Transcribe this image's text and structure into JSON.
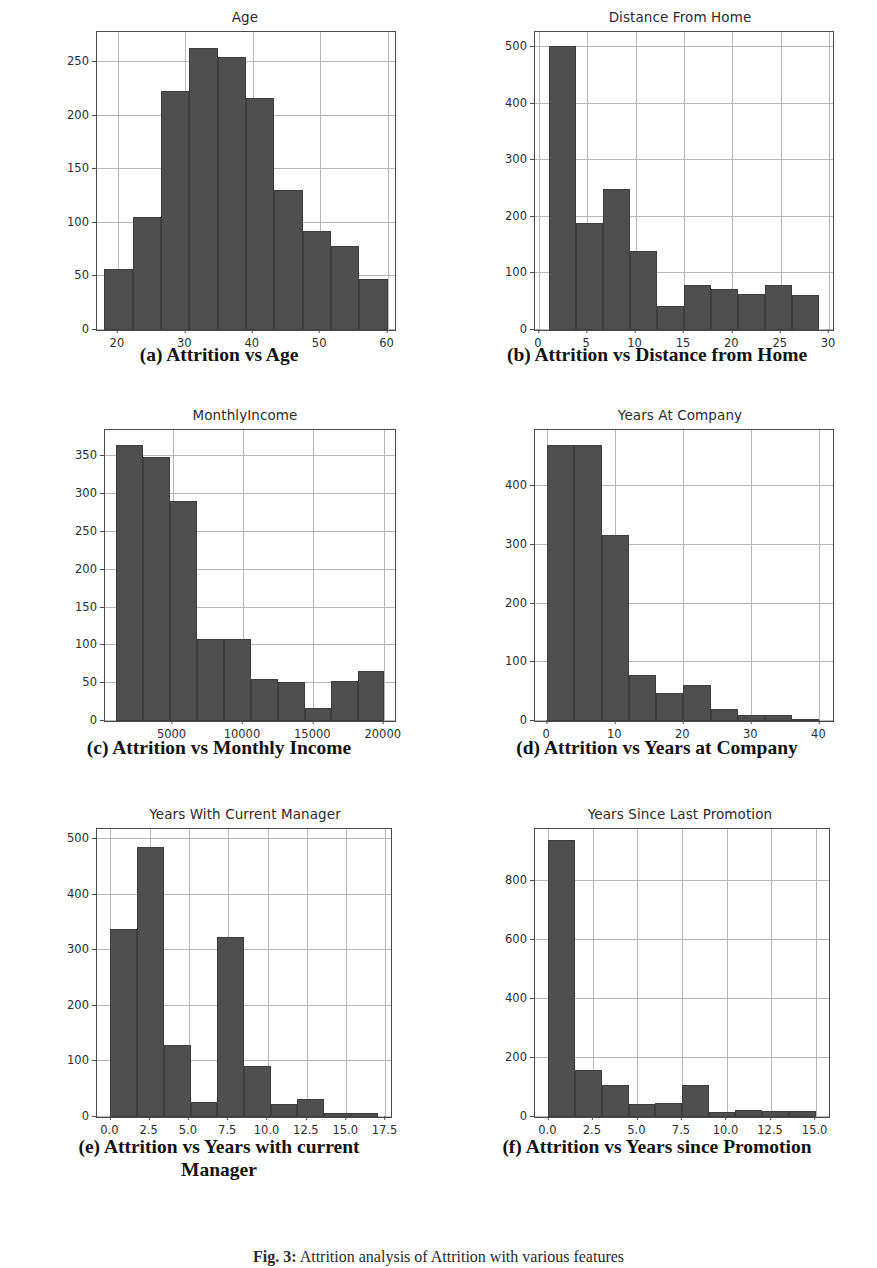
{
  "figure": {
    "caption_label": "Fig. 3:",
    "caption_text": "Attrition analysis of Attrition with various features"
  },
  "panels": [
    {
      "key": "a",
      "subcaption": "(a) Attrition vs Age",
      "chart_data": {
        "type": "bar",
        "title": "Age",
        "xlabel": "",
        "ylabel": "",
        "grid": true,
        "legend": "none",
        "xlim": [
          16.9,
          61.1
        ],
        "ylim": [
          0,
          278
        ],
        "xticks": [
          "20",
          "30",
          "40",
          "50",
          "60"
        ],
        "xtick_values": [
          20,
          30,
          40,
          50,
          60
        ],
        "yticks": [
          "0",
          "50",
          "100",
          "150",
          "200",
          "250"
        ],
        "ytick_values": [
          0,
          50,
          100,
          150,
          200,
          250
        ],
        "bin_edges": [
          18,
          22.2,
          26.4,
          30.6,
          34.8,
          39,
          43.2,
          47.4,
          51.6,
          55.8,
          60
        ],
        "categories": [
          "18-22.2",
          "22.2-26.4",
          "26.4-30.6",
          "30.6-34.8",
          "34.8-39",
          "39-43.2",
          "43.2-47.4",
          "47.4-51.6",
          "51.6-55.8",
          "55.8-60"
        ],
        "values": [
          57,
          105,
          223,
          263,
          255,
          216,
          131,
          92,
          78,
          48
        ]
      }
    },
    {
      "key": "b",
      "subcaption": "(b) Attrition vs Distance from Home",
      "chart_data": {
        "type": "bar",
        "title": "Distance From Home",
        "xlabel": "",
        "ylabel": "",
        "grid": true,
        "legend": "none",
        "xlim": [
          -0.4,
          30.4
        ],
        "ylim": [
          0,
          527
        ],
        "xticks": [
          "0",
          "5",
          "10",
          "15",
          "20",
          "25",
          "30"
        ],
        "xtick_values": [
          0,
          5,
          10,
          15,
          20,
          25,
          30
        ],
        "yticks": [
          "0",
          "100",
          "200",
          "300",
          "400",
          "500"
        ],
        "ytick_values": [
          0,
          100,
          200,
          300,
          400,
          500
        ],
        "bin_edges": [
          1,
          3.8,
          6.6,
          9.4,
          12.2,
          15,
          17.8,
          20.6,
          23.4,
          26.2,
          29
        ],
        "categories": [
          "1-3.8",
          "3.8-6.6",
          "6.6-9.4",
          "9.4-12.2",
          "12.2-15",
          "15-17.8",
          "17.8-20.6",
          "20.6-23.4",
          "23.4-26.2",
          "26.2-29"
        ],
        "values": [
          503,
          189,
          250,
          139,
          43,
          79,
          72,
          63,
          80,
          62
        ]
      }
    },
    {
      "key": "c",
      "subcaption": "(c) Attrition vs Monthly Income",
      "chart_data": {
        "type": "bar",
        "title": "MonthlyIncome",
        "xlabel": "",
        "ylabel": "",
        "grid": true,
        "legend": "none",
        "xlim": [
          200,
          20800
        ],
        "ylim": [
          0,
          385
        ],
        "xticks": [
          "5000",
          "10000",
          "15000",
          "20000"
        ],
        "xtick_values": [
          5000,
          10000,
          15000,
          20000
        ],
        "yticks": [
          "0",
          "50",
          "100",
          "150",
          "200",
          "250",
          "300",
          "350"
        ],
        "ytick_values": [
          0,
          50,
          100,
          150,
          200,
          250,
          300,
          350
        ],
        "bin_edges": [
          1009,
          2919,
          4829,
          6739,
          8649,
          10559,
          12469,
          14379,
          16289,
          18199,
          19999
        ],
        "categories": [
          "1009-2919",
          "2919-4829",
          "4829-6739",
          "6739-8649",
          "8649-10559",
          "10559-12469",
          "12469-14379",
          "14379-16289",
          "16289-18199",
          "18199-19999"
        ],
        "values": [
          365,
          349,
          291,
          109,
          109,
          55,
          52,
          17,
          53,
          66
        ]
      }
    },
    {
      "key": "d",
      "subcaption": "(d) Attrition vs Years at Company",
      "chart_data": {
        "type": "bar",
        "title": "Years At Company",
        "xlabel": "",
        "ylabel": "",
        "grid": true,
        "legend": "none",
        "xlim": [
          -1.8,
          42
        ],
        "ylim": [
          0,
          496
        ],
        "xticks": [
          "0",
          "10",
          "20",
          "30",
          "40"
        ],
        "xtick_values": [
          0,
          10,
          20,
          30,
          40
        ],
        "yticks": [
          "0",
          "100",
          "200",
          "300",
          "400"
        ],
        "ytick_values": [
          0,
          100,
          200,
          300,
          400
        ],
        "bin_edges": [
          0,
          4,
          8,
          12,
          16,
          20,
          24,
          28,
          32,
          36,
          40
        ],
        "categories": [
          "0-4",
          "4-8",
          "8-12",
          "12-16",
          "16-20",
          "20-24",
          "24-28",
          "28-32",
          "32-36",
          "36-40"
        ],
        "values": [
          470,
          470,
          317,
          79,
          48,
          62,
          20,
          10,
          11,
          4
        ]
      }
    },
    {
      "key": "e",
      "subcaption": "(e) Attrition vs Years with current Manager",
      "chart_data": {
        "type": "bar",
        "title": "Years With Current Manager",
        "xlabel": "",
        "ylabel": "",
        "grid": true,
        "legend": "none",
        "xlim": [
          -0.85,
          17.85
        ],
        "ylim": [
          0,
          518
        ],
        "xticks": [
          "0.0",
          "2.5",
          "5.0",
          "7.5",
          "10.0",
          "12.5",
          "15.0",
          "17.5"
        ],
        "xtick_values": [
          0.0,
          2.5,
          5.0,
          7.5,
          10.0,
          12.5,
          15.0,
          17.5
        ],
        "yticks": [
          "0",
          "100",
          "200",
          "300",
          "400",
          "500"
        ],
        "ytick_values": [
          0,
          100,
          200,
          300,
          400,
          500
        ],
        "bin_edges": [
          0,
          1.7,
          3.4,
          5.1,
          6.8,
          8.5,
          10.2,
          11.9,
          13.6,
          15.3,
          17
        ],
        "categories": [
          "0-1.7",
          "1.7-3.4",
          "3.4-5.1",
          "5.1-6.8",
          "6.8-8.5",
          "8.5-10.2",
          "10.2-11.9",
          "11.9-13.6",
          "13.6-15.3",
          "15.3-17"
        ],
        "values": [
          339,
          485,
          129,
          27,
          324,
          92,
          23,
          32,
          8,
          8
        ]
      }
    },
    {
      "key": "f",
      "subcaption": "(f) Attrition vs Years since Promotion",
      "chart_data": {
        "type": "bar",
        "title": "Years Since Last Promotion",
        "xlabel": "",
        "ylabel": "",
        "grid": true,
        "legend": "none",
        "xlim": [
          -0.75,
          15.75
        ],
        "ylim": [
          0,
          975
        ],
        "xticks": [
          "0.0",
          "2.5",
          "5.0",
          "7.5",
          "10.0",
          "12.5",
          "15.0"
        ],
        "xtick_values": [
          0.0,
          2.5,
          5.0,
          7.5,
          10.0,
          12.5,
          15.0
        ],
        "yticks": [
          "0",
          "200",
          "400",
          "600",
          "800"
        ],
        "ytick_values": [
          0,
          200,
          400,
          600,
          800
        ],
        "bin_edges": [
          0,
          1.5,
          3,
          4.5,
          6,
          7.5,
          9,
          10.5,
          12,
          13.5,
          15
        ],
        "categories": [
          "0-1.5",
          "1.5-3",
          "3-4.5",
          "4.5-6",
          "6-7.5",
          "7.5-9",
          "9-10.5",
          "10.5-12",
          "12-13.5",
          "13.5-15"
        ],
        "values": [
          937,
          159,
          110,
          45,
          48,
          107,
          16,
          23,
          21,
          20
        ]
      }
    }
  ],
  "colors": {
    "bar_fill": "#4f4f4f",
    "bar_edge": "#3d3d3d",
    "grid": "#b8b8b8",
    "axis": "#4b4b4b",
    "text": "#2d2d2d",
    "background": "#ffffff"
  }
}
